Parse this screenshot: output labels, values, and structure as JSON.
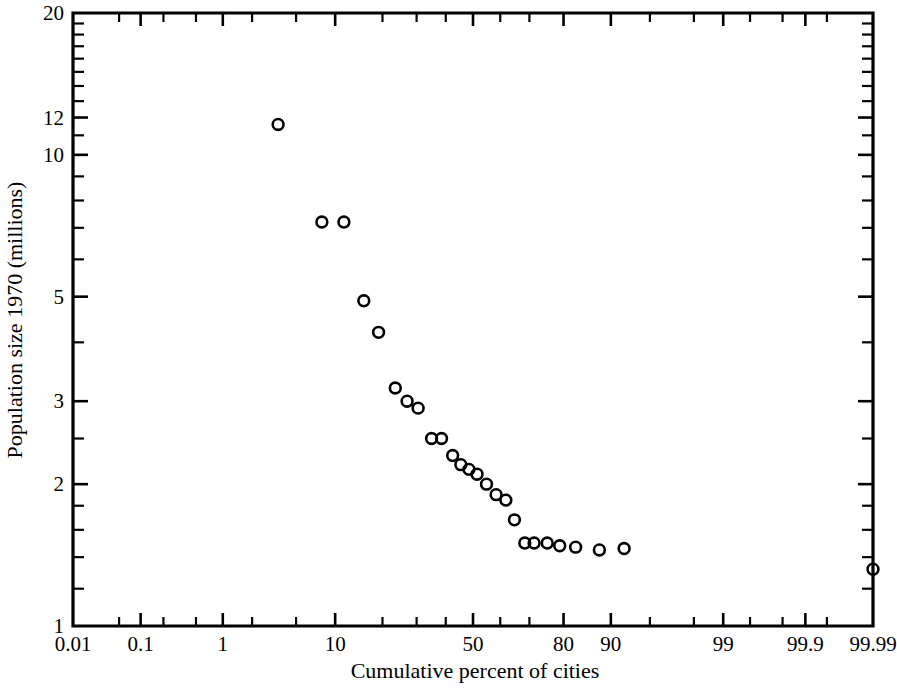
{
  "chart_data": {
    "type": "scatter",
    "title": "",
    "subtitle": "",
    "xlabel": "Cumulative percent of cities",
    "ylabel": "Population size 1970 (millions)",
    "x_scale": "normal-probability",
    "y_scale": "log",
    "xlim": [
      0.01,
      99.99
    ],
    "ylim": [
      1,
      20
    ],
    "grid": false,
    "legend": null,
    "marker_style": "open-circle",
    "x_tick_labels": [
      "0.01",
      "0.1",
      "1",
      "10",
      "50",
      "80",
      "90",
      "99",
      "99.9",
      "99.99"
    ],
    "x_tick_values": [
      0.01,
      0.1,
      1,
      10,
      50,
      80,
      90,
      99,
      99.9,
      99.99
    ],
    "x_minor_ticks": [
      0.05,
      0.2,
      0.5,
      2,
      5,
      20,
      30,
      40,
      60,
      70,
      95,
      98,
      99.5,
      99.8,
      99.95
    ],
    "y_tick_labels": [
      "20",
      "12",
      "10",
      "5",
      "3",
      "2",
      "1"
    ],
    "y_tick_values": [
      20,
      12,
      10,
      5,
      3,
      2,
      1
    ],
    "y_minor_ticks": [
      19,
      18,
      17,
      16,
      15,
      14,
      13,
      11,
      9,
      8,
      7,
      6,
      4,
      2.5,
      1.8,
      1.6,
      1.4,
      1.2
    ],
    "points": [
      {
        "x": 3.5,
        "y": 11.6
      },
      {
        "x": 8.0,
        "y": 7.2
      },
      {
        "x": 11.5,
        "y": 7.2
      },
      {
        "x": 15.5,
        "y": 4.9
      },
      {
        "x": 19.0,
        "y": 4.2
      },
      {
        "x": 23.5,
        "y": 3.2
      },
      {
        "x": 27.0,
        "y": 3.0
      },
      {
        "x": 30.5,
        "y": 2.9
      },
      {
        "x": 35.0,
        "y": 2.5
      },
      {
        "x": 38.5,
        "y": 2.5
      },
      {
        "x": 42.5,
        "y": 2.3
      },
      {
        "x": 45.5,
        "y": 2.2
      },
      {
        "x": 48.5,
        "y": 2.15
      },
      {
        "x": 51.5,
        "y": 2.1
      },
      {
        "x": 55.0,
        "y": 2.0
      },
      {
        "x": 58.5,
        "y": 1.9
      },
      {
        "x": 62.0,
        "y": 1.85
      },
      {
        "x": 65.0,
        "y": 1.68
      },
      {
        "x": 68.5,
        "y": 1.5
      },
      {
        "x": 71.5,
        "y": 1.5
      },
      {
        "x": 75.5,
        "y": 1.5
      },
      {
        "x": 79.0,
        "y": 1.48
      },
      {
        "x": 83.0,
        "y": 1.47
      },
      {
        "x": 88.0,
        "y": 1.45
      },
      {
        "x": 92.0,
        "y": 1.46
      },
      {
        "x": 99.99,
        "y": 1.32
      }
    ],
    "annotations": []
  },
  "axes": {
    "x_title": "Cumulative percent of cities",
    "y_title": "Population size 1970 (millions)"
  }
}
